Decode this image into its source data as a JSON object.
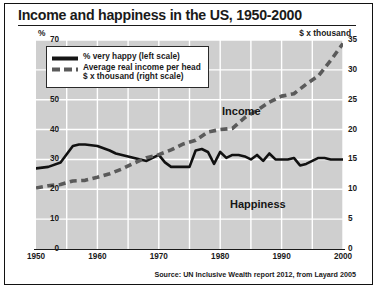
{
  "title": "Income and happiness in the US, 1950-2000",
  "axis_unit_left": "%",
  "axis_unit_right": "$ x thousand",
  "legend": {
    "happy_label": "% very happy (left scale)",
    "income_label_line1": "Average real income per head",
    "income_label_line2": "$ x thousand (right scale)",
    "happy_key": "solid-line-key",
    "income_key": "dashed-line-key"
  },
  "annotations": {
    "income": "Income",
    "happiness": "Happiness"
  },
  "source": "Source: UN Inclusive Wealth report 2012, from Layard 2005",
  "colors": {
    "plot_background": "#cfcfcf",
    "gridline": "#ffffff",
    "happiness_line": "#111111",
    "income_line": "#5a5a5a",
    "frame": "#121212",
    "text": "#1a1a1a"
  },
  "chart_data": {
    "type": "line",
    "title": "Income and happiness in the US, 1950-2000",
    "xlabel": "",
    "ylabel": "%",
    "y2label": "$ x thousand",
    "xlim": [
      1950,
      2000
    ],
    "ylim": [
      0,
      70
    ],
    "y2lim": [
      0,
      35
    ],
    "grid": true,
    "legend_position": "upper-left",
    "xticks": [
      1950,
      1960,
      1970,
      1980,
      1990,
      2000
    ],
    "xticks_minor": [
      1955,
      1965,
      1975,
      1985,
      1995
    ],
    "yticks_left": [
      0,
      10,
      20,
      30,
      40,
      50,
      60,
      70
    ],
    "yticks_right": [
      0,
      5,
      10,
      15,
      20,
      25,
      30,
      35
    ],
    "series": [
      {
        "name": "% very happy (left scale)",
        "axis": "left",
        "style": "solid",
        "color": "#111111",
        "x": [
          1950,
          1952,
          1954,
          1956,
          1957,
          1958,
          1960,
          1962,
          1963,
          1964,
          1965,
          1966,
          1967,
          1968,
          1969,
          1970,
          1971,
          1972,
          1973,
          1974,
          1975,
          1976,
          1977,
          1978,
          1979,
          1980,
          1981,
          1982,
          1983,
          1984,
          1985,
          1986,
          1987,
          1988,
          1989,
          1990,
          1991,
          1992,
          1993,
          1994,
          1995,
          1996,
          1997,
          1998,
          1999,
          2000
        ],
        "values": [
          27.0,
          27.5,
          29.0,
          34.5,
          35.0,
          35.0,
          34.5,
          33.0,
          32.0,
          31.5,
          31.0,
          30.5,
          30.0,
          29.5,
          30.5,
          31.5,
          29.0,
          27.5,
          27.5,
          27.5,
          27.5,
          33.0,
          33.5,
          32.5,
          28.5,
          32.5,
          30.5,
          31.5,
          31.5,
          31.0,
          30.0,
          31.5,
          29.5,
          32.0,
          30.0,
          30.0,
          30.0,
          30.5,
          28.0,
          28.5,
          29.5,
          30.5,
          30.5,
          30.0,
          30.0,
          30.0
        ]
      },
      {
        "name": "Average real income per head $ x thousand (right scale)",
        "axis": "right",
        "style": "dashed",
        "color": "#5a5a5a",
        "x": [
          1950,
          1952,
          1954,
          1956,
          1958,
          1960,
          1962,
          1964,
          1966,
          1968,
          1970,
          1972,
          1974,
          1976,
          1978,
          1980,
          1982,
          1984,
          1986,
          1988,
          1990,
          1992,
          1994,
          1996,
          1998,
          2000
        ],
        "values": [
          10.2,
          10.6,
          10.8,
          11.4,
          11.5,
          12.0,
          12.6,
          13.4,
          14.4,
          15.3,
          15.8,
          16.6,
          17.6,
          18.2,
          19.6,
          20.0,
          20.2,
          22.0,
          23.2,
          24.6,
          25.6,
          26.0,
          27.6,
          29.0,
          31.6,
          34.4
        ]
      }
    ]
  }
}
